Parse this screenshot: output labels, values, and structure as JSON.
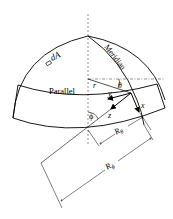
{
  "diagram": {
    "labels": {
      "dA": "dA",
      "meridian": "Meridian",
      "parallel": "Parallel",
      "r": "r",
      "theta": "θ",
      "phi": "ϕ",
      "x": "x",
      "y": "y",
      "z": "z",
      "R_theta": "R",
      "R_theta_sub": "θ",
      "R_phi": "R",
      "R_phi_sub": "ϕ"
    },
    "colors": {
      "stroke": "#000000",
      "axis": "#555555",
      "background": "#ffffff"
    }
  }
}
